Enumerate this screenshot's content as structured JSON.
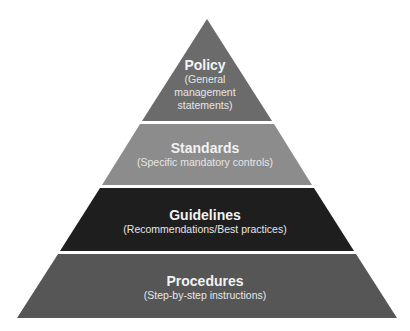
{
  "diagram": {
    "type": "pyramid",
    "tiers": [
      {
        "title": "Policy",
        "subtitle_lines": [
          "(General",
          "management",
          "statements)"
        ],
        "color": "#6b6b6b"
      },
      {
        "title": "Standards",
        "subtitle_lines": [
          "(Specific mandatory controls)"
        ],
        "color": "#8c8c8c"
      },
      {
        "title": "Guidelines",
        "subtitle_lines": [
          "(Recommendations/Best practices)"
        ],
        "color": "#1e1e1e"
      },
      {
        "title": "Procedures",
        "subtitle_lines": [
          "(Step-by-step instructions)"
        ],
        "color": "#565656"
      }
    ]
  }
}
